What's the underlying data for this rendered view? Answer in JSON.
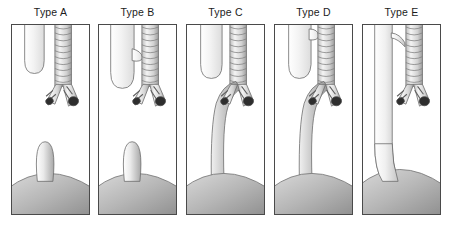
{
  "figure": {
    "background_color": "#ffffff",
    "panel_count": 5,
    "panel_border_color": "#4a4a4a",
    "label_color": "#1c1c1c"
  },
  "colors": {
    "trachea_light": "#f2f2f2",
    "trachea_mid": "#d0d0d0",
    "trachea_dark": "#8f8f8f",
    "esophagus_light": "#f4f4f4",
    "esophagus_mid": "#c8c8c8",
    "esophagus_dark": "#9a9a9a",
    "stomach_light": "#d8d8d8",
    "stomach_mid": "#b4b4b4",
    "stomach_dark": "#8a8a8a",
    "bronchus_lumen": "#2e2e2e",
    "outline": "#5a5a5a"
  },
  "panels": [
    {
      "id": "type-a",
      "label": "Type A",
      "x": 11,
      "structures": {
        "upper_pouch": "blind-ending proximal esophageal pouch",
        "trachea": "trachea with cartilage rings",
        "bronchi": "left and right mainstem bronchi",
        "lower_segment": "short blind distal esophageal stump on stomach",
        "stomach": "stomach dome",
        "fistula": "none"
      }
    },
    {
      "id": "type-b",
      "label": "Type B",
      "x": 98,
      "structures": {
        "upper_pouch": "proximal esophageal pouch",
        "trachea": "trachea with cartilage rings",
        "bronchi": "left and right mainstem bronchi",
        "lower_segment": "short blind distal esophageal stump on stomach",
        "stomach": "stomach dome",
        "fistula": "proximal tracheoesophageal fistula"
      }
    },
    {
      "id": "type-c",
      "label": "Type C",
      "x": 186,
      "structures": {
        "upper_pouch": "blind-ending proximal esophageal pouch",
        "trachea": "trachea with cartilage rings",
        "bronchi": "left and right mainstem bronchi",
        "lower_segment": "distal esophagus rising from stomach to carina",
        "stomach": "stomach dome",
        "fistula": "distal tracheoesophageal fistula"
      }
    },
    {
      "id": "type-d",
      "label": "Type D",
      "x": 274,
      "structures": {
        "upper_pouch": "proximal esophageal pouch",
        "trachea": "trachea with cartilage rings",
        "bronchi": "left and right mainstem bronchi",
        "lower_segment": "distal esophagus rising from stomach to carina",
        "stomach": "stomach dome",
        "fistula": "proximal and distal tracheoesophageal fistulae"
      }
    },
    {
      "id": "type-e",
      "label": "Type E",
      "x": 362,
      "structures": {
        "upper_pouch": "continuous esophagus (no atresia)",
        "trachea": "trachea with cartilage rings",
        "bronchi": "left and right mainstem bronchi",
        "lower_segment": "continuous esophagus entering stomach",
        "stomach": "stomach dome",
        "fistula": "H-type tracheoesophageal fistula"
      }
    }
  ]
}
